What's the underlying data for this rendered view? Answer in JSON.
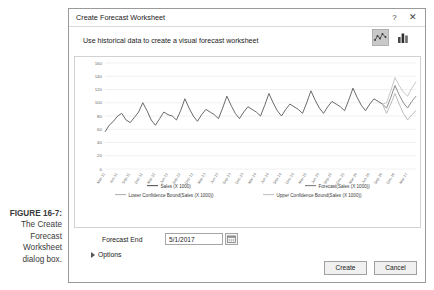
{
  "figure": {
    "label": "FIGURE 16-7:",
    "text": "The Create Forecast Worksheet dialog box."
  },
  "dialog": {
    "title": "Create Forecast Worksheet",
    "help_icon": "?",
    "close_icon": "✕",
    "subheader": "Use historical data to create a visual forecast worksheet",
    "chart_type_icons": [
      {
        "name": "line-chart-icon",
        "selected": true
      },
      {
        "name": "column-chart-icon",
        "selected": false
      }
    ],
    "forecast_end": {
      "label": "Forecast End",
      "value": "5/1/2017",
      "placeholder": "5/1/2017",
      "date_picker_icon": "calendar-icon"
    },
    "options": {
      "label": "Options",
      "expanded": false
    },
    "buttons": {
      "create": "Create",
      "cancel": "Cancel"
    }
  },
  "colors": {
    "historical_line": "#595959",
    "forecast_line": "#808080",
    "lower_bound": "#b4b4b4",
    "upper_bound": "#c2c2c2",
    "gridline": "#ebebeb",
    "dialog_border": "#9a9a9a",
    "selected_icon_bg": "#c9c9c9"
  },
  "chart_data": {
    "type": "line",
    "title": "",
    "xlabel": "",
    "ylabel": "",
    "ylim": [
      0,
      160
    ],
    "yticks": [
      0,
      20,
      40,
      60,
      80,
      100,
      120,
      140,
      160
    ],
    "grid": true,
    "legend_position": "bottom",
    "categories": [
      "Mar-11",
      "Apr-11",
      "May-11",
      "Jun-11",
      "Jul-11",
      "Aug-11",
      "Sep-11",
      "Oct-11",
      "Nov-11",
      "Dec-11",
      "Jan-12",
      "Feb-12",
      "Mar-12",
      "Apr-12",
      "May-12",
      "Jun-12",
      "Jul-12",
      "Aug-12",
      "Sep-12",
      "Oct-12",
      "Nov-12",
      "Dec-12",
      "Jan-13",
      "Feb-13",
      "Mar-13",
      "Apr-13",
      "May-13",
      "Jun-13",
      "Jul-13",
      "Aug-13",
      "Sep-13",
      "Oct-13",
      "Nov-13",
      "Dec-13",
      "Jan-14",
      "Feb-14",
      "Mar-14",
      "Apr-14",
      "May-14",
      "Jun-14",
      "Jul-14",
      "Aug-14",
      "Sep-14",
      "Oct-14",
      "Nov-14",
      "Dec-14",
      "Jan-15",
      "Feb-15",
      "Mar-15",
      "Apr-15",
      "May-15",
      "Jun-15",
      "Jul-15",
      "Aug-15",
      "Sep-15",
      "Oct-15",
      "Nov-15",
      "Dec-15",
      "Jan-16",
      "Feb-16",
      "Mar-16",
      "Apr-16",
      "May-16",
      "Jun-16",
      "Jul-16",
      "Aug-16",
      "Sep-16",
      "Oct-16",
      "Nov-16",
      "Dec-16",
      "Jan-17",
      "Feb-17",
      "Mar-17",
      "Apr-17",
      "May-17"
    ],
    "xtick_labels": [
      "Mar-11",
      "Jun-11",
      "Sep-11",
      "Dec-11",
      "Mar-12",
      "Jun-12",
      "Sep-12",
      "Dec-12",
      "Mar-13",
      "Jun-13",
      "Sep-13",
      "Dec-13",
      "Mar-14",
      "Jun-14",
      "Sep-14",
      "Dec-14",
      "Mar-15",
      "Jun-15",
      "Sep-15",
      "Dec-15",
      "Mar-16",
      "Jun-16",
      "Sep-16",
      "Dec-16",
      "Mar-17"
    ],
    "series": [
      {
        "name": "Sales (X 1000)",
        "color": "#595959",
        "values": [
          56,
          66,
          72,
          80,
          84,
          74,
          70,
          78,
          86,
          100,
          88,
          74,
          66,
          76,
          86,
          82,
          80,
          74,
          88,
          106,
          92,
          80,
          72,
          82,
          90,
          86,
          82,
          76,
          92,
          110,
          96,
          84,
          76,
          86,
          94,
          90,
          86,
          80,
          96,
          114,
          100,
          88,
          80,
          90,
          98,
          94,
          90,
          84,
          100,
          118,
          104,
          92,
          84,
          94,
          102,
          98,
          94,
          88,
          104,
          122,
          108,
          96,
          88,
          98,
          106,
          102,
          98,
          null,
          null,
          null,
          null,
          null,
          null,
          null,
          null
        ]
      },
      {
        "name": "Forecast(Sales (X 1000))",
        "color": "#808080",
        "values": [
          null,
          null,
          null,
          null,
          null,
          null,
          null,
          null,
          null,
          null,
          null,
          null,
          null,
          null,
          null,
          null,
          null,
          null,
          null,
          null,
          null,
          null,
          null,
          null,
          null,
          null,
          null,
          null,
          null,
          null,
          null,
          null,
          null,
          null,
          null,
          null,
          null,
          null,
          null,
          null,
          null,
          null,
          null,
          null,
          null,
          null,
          null,
          null,
          null,
          null,
          null,
          null,
          null,
          null,
          null,
          null,
          null,
          null,
          null,
          null,
          null,
          null,
          null,
          null,
          null,
          null,
          98,
          92,
          108,
          126,
          112,
          100,
          92,
          102,
          110
        ]
      },
      {
        "name": "Lower Confidence Bound(Sales (X 1000))",
        "color": "#b4b4b4",
        "values": [
          null,
          null,
          null,
          null,
          null,
          null,
          null,
          null,
          null,
          null,
          null,
          null,
          null,
          null,
          null,
          null,
          null,
          null,
          null,
          null,
          null,
          null,
          null,
          null,
          null,
          null,
          null,
          null,
          null,
          null,
          null,
          null,
          null,
          null,
          null,
          null,
          null,
          null,
          null,
          null,
          null,
          null,
          null,
          null,
          null,
          null,
          null,
          null,
          null,
          null,
          null,
          null,
          null,
          null,
          null,
          null,
          null,
          null,
          null,
          null,
          null,
          null,
          null,
          null,
          null,
          null,
          98,
          84,
          98,
          114,
          98,
          84,
          74,
          82,
          88
        ]
      },
      {
        "name": "Upper Confidence Bound(Sales (X 1000))",
        "color": "#c2c2c2",
        "values": [
          null,
          null,
          null,
          null,
          null,
          null,
          null,
          null,
          null,
          null,
          null,
          null,
          null,
          null,
          null,
          null,
          null,
          null,
          null,
          null,
          null,
          null,
          null,
          null,
          null,
          null,
          null,
          null,
          null,
          null,
          null,
          null,
          null,
          null,
          null,
          null,
          null,
          null,
          null,
          null,
          null,
          null,
          null,
          null,
          null,
          null,
          null,
          null,
          null,
          null,
          null,
          null,
          null,
          null,
          null,
          null,
          null,
          null,
          null,
          null,
          null,
          null,
          null,
          null,
          null,
          null,
          98,
          100,
          118,
          138,
          126,
          116,
          110,
          122,
          132
        ]
      }
    ],
    "legend": [
      "Sales (X 1000)",
      "Forecast(Sales (X 1000))",
      "Lower Confidence Bound(Sales (X 1000))",
      "Upper Confidence Bound(Sales (X 1000))"
    ]
  }
}
